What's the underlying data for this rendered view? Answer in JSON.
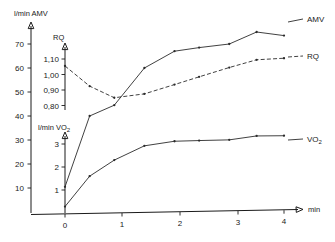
{
  "chart_data": {
    "type": "line",
    "title": "",
    "xlabel": "min",
    "xlim": [
      -0.25,
      4.4
    ],
    "xticks": [
      0,
      1,
      2,
      3,
      4
    ],
    "xticklabels": [
      "0",
      "1",
      "2",
      "3",
      "4"
    ],
    "grid": false,
    "legend_position": "right-of-curve-ends",
    "axes": [
      {
        "id": "amv",
        "label": "l/min AMV",
        "unit": "l/min",
        "quantity": "AMV",
        "ticks": [
          10,
          20,
          30,
          40,
          50,
          60,
          70
        ],
        "ticklabels": [
          "10",
          "20",
          "30",
          "40",
          "50",
          "60",
          "70"
        ],
        "ylim": [
          0,
          76
        ]
      },
      {
        "id": "rq",
        "label": "RQ",
        "unit": "",
        "quantity": "RQ",
        "ticks": [
          0.8,
          0.9,
          1.0,
          1.1
        ],
        "ticklabels": [
          "0,80",
          "0,90",
          "1,00",
          "1,10"
        ],
        "ylim": [
          0.78,
          1.15
        ]
      },
      {
        "id": "vo2",
        "label": "l/min VO2",
        "unit": "l/min",
        "quantity": "VO2",
        "ticks": [
          1,
          2,
          3
        ],
        "ticklabels": [
          "1",
          "2",
          "3"
        ],
        "ylim": [
          0.2,
          3.5
        ]
      }
    ],
    "series": [
      {
        "name": "AMV",
        "label": "AMV",
        "axis": "amv",
        "style": "solid",
        "x": [
          0,
          0.45,
          0.9,
          1.45,
          2.0,
          2.45,
          3.0,
          3.5,
          4.0
        ],
        "values": [
          10.5,
          40,
          44.5,
          60,
          67,
          68.5,
          70,
          75,
          73.5
        ]
      },
      {
        "name": "RQ",
        "label": "RQ",
        "axis": "rq",
        "style": "dashed",
        "x": [
          0,
          0.45,
          0.9,
          1.45,
          2.0,
          2.45,
          3.0,
          3.5,
          4.0
        ],
        "values": [
          1.055,
          0.925,
          0.85,
          0.875,
          0.935,
          0.985,
          1.045,
          1.095,
          1.105
        ]
      },
      {
        "name": "VO2",
        "label": "VO2",
        "axis": "vo2",
        "style": "solid",
        "x": [
          0,
          0.45,
          0.9,
          1.45,
          2.0,
          2.45,
          3.0,
          3.5,
          4.0
        ],
        "values": [
          0.28,
          1.6,
          2.3,
          2.92,
          3.12,
          3.15,
          3.18,
          3.35,
          3.36
        ]
      }
    ]
  },
  "labels": {
    "axis_amv": "l/min AMV",
    "axis_rq": "RQ",
    "axis_vo2_prefix": "l/min VO",
    "axis_vo2_sub": "2",
    "x_axis": "min",
    "series_amv": "AMV",
    "series_rq": "RQ",
    "series_vo2_prefix": "VO",
    "series_vo2_sub": "2",
    "amv_ticks": [
      "70",
      "60",
      "50",
      "40",
      "30",
      "20",
      "10"
    ],
    "rq_ticks": [
      "1,10",
      "1,00",
      "0,90",
      "0,80"
    ],
    "vo2_ticks": [
      "3",
      "2",
      "1"
    ],
    "x_ticks": [
      "0",
      "1",
      "2",
      "3",
      "4"
    ]
  },
  "colors": {
    "ink": "#1a1a1a",
    "curve": "#2b2b2b",
    "background": "#ffffff"
  }
}
